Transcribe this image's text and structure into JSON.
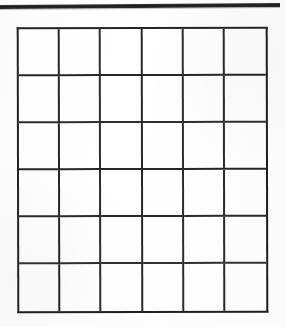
{
  "document": {
    "kind": "scanned-worksheet",
    "background_color": "#fefefe",
    "ink_color": "#2b2b2b",
    "page_title": "",
    "caption": ""
  },
  "top_rule": {
    "name": "horizontal-rule",
    "color": "#242424",
    "thickness_px": 4,
    "label": ""
  },
  "grid": {
    "rows": 6,
    "columns": 6,
    "border_color": "#242424",
    "line_color": "#2b2b2b",
    "fill_color": "#ffffff",
    "cells": [
      [
        "",
        "",
        "",
        "",
        "",
        ""
      ],
      [
        "",
        "",
        "",
        "",
        "",
        ""
      ],
      [
        "",
        "",
        "",
        "",
        "",
        ""
      ],
      [
        "",
        "",
        "",
        "",
        "",
        ""
      ],
      [
        "",
        "",
        "",
        "",
        "",
        ""
      ],
      [
        "",
        "",
        "",
        "",
        "",
        ""
      ]
    ]
  }
}
